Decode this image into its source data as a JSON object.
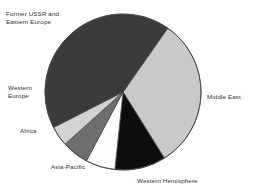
{
  "chart_data": {
    "type": "pie",
    "title": "",
    "subtitle": "",
    "xlabel": "",
    "ylabel": "",
    "grid": false,
    "legend_position": "none",
    "labels_position": "outside",
    "center": {
      "x": 123,
      "y": 92
    },
    "radius": 78,
    "start_angle_deg": 35,
    "direction": "clockwise",
    "categories": [
      "Middle East",
      "Western Hemisphere",
      "Asia-Pacific",
      "Africa",
      "Western Europe",
      "Former USSR and Eastern Europe"
    ],
    "values": [
      31.4,
      10.6,
      6.1,
      5.6,
      4.2,
      42.1
    ],
    "unit": "percent",
    "slices": [
      {
        "label": "Middle East",
        "label_lines": [
          "Middle East"
        ],
        "value": 31.4,
        "color": "#c9c9c9",
        "start_deg": 35,
        "end_deg": 148
      },
      {
        "label": "Western Hemisphere",
        "label_lines": [
          "Western Hemisphere"
        ],
        "value": 10.6,
        "color": "#0d0d0d",
        "start_deg": 148,
        "end_deg": 186
      },
      {
        "label": "Asia-Pacific",
        "label_lines": [
          "Asia-Pacific"
        ],
        "value": 6.1,
        "color": "#fdfdfd",
        "start_deg": 186,
        "end_deg": 208
      },
      {
        "label": "Africa",
        "label_lines": [
          "Africa"
        ],
        "value": 5.6,
        "color": "#6e6e6e",
        "start_deg": 208,
        "end_deg": 228
      },
      {
        "label": "Western Europe",
        "label_lines": [
          "Western",
          "Europe"
        ],
        "value": 4.2,
        "color": "#d2d2d2",
        "start_deg": 228,
        "end_deg": 243
      },
      {
        "label": "Former USSR and Eastern Europe",
        "label_lines": [
          "Former USSR and",
          "Eastern Europe"
        ],
        "value": 42.1,
        "color": "#3b3b3b",
        "start_deg": 243,
        "end_deg": 395
      }
    ],
    "stroke_color": "#4a4a4a",
    "background": "#ffffff"
  },
  "labels": {
    "former_ussr": "Former USSR and\nEastern Europe",
    "western_europe": "Western\nEurope",
    "africa": "Africa",
    "asia_pacific": "Asia-Pacific",
    "western_hemisphere": "Western Hemisphere",
    "middle_east": "Middle East"
  }
}
